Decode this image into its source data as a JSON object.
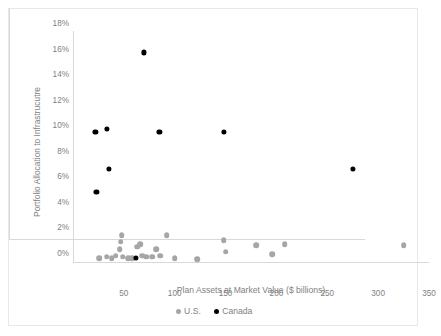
{
  "chart_data": {
    "type": "scatter",
    "title": "",
    "xlabel": "Plan Assets at Market Value ($ billions)",
    "ylabel": "Portfolio Allocation to Infrastrucutre",
    "xlim": [
      0,
      350
    ],
    "ylim": [
      0,
      18
    ],
    "xticks": [
      "50",
      "100",
      "150",
      "200",
      "250",
      "300",
      "350"
    ],
    "xtick_values": [
      50,
      100,
      150,
      200,
      250,
      300,
      350
    ],
    "yticks": [
      "0%",
      "2%",
      "4%",
      "6%",
      "8%",
      "10%",
      "12%",
      "14%",
      "16%",
      "18%"
    ],
    "ytick_values": [
      0,
      2,
      4,
      6,
      8,
      10,
      12,
      14,
      16,
      18
    ],
    "grid": false,
    "legend_position": "bottom-center",
    "series": [
      {
        "name": "U.S.",
        "color": "#a6a6a6",
        "marker": "circle",
        "points": [
          {
            "x": 26,
            "y": 0.3
          },
          {
            "x": 33,
            "y": 0.4
          },
          {
            "x": 38,
            "y": 0.3
          },
          {
            "x": 42,
            "y": 0.5
          },
          {
            "x": 46,
            "y": 1.0
          },
          {
            "x": 47,
            "y": 1.6
          },
          {
            "x": 48,
            "y": 2.1
          },
          {
            "x": 49,
            "y": 0.4
          },
          {
            "x": 54,
            "y": 0.3
          },
          {
            "x": 58,
            "y": 0.3
          },
          {
            "x": 63,
            "y": 1.2
          },
          {
            "x": 66,
            "y": 1.4
          },
          {
            "x": 68,
            "y": 0.5
          },
          {
            "x": 72,
            "y": 0.4
          },
          {
            "x": 78,
            "y": 0.4
          },
          {
            "x": 82,
            "y": 1.0
          },
          {
            "x": 86,
            "y": 0.5
          },
          {
            "x": 92,
            "y": 2.1
          },
          {
            "x": 100,
            "y": 0.3
          },
          {
            "x": 122,
            "y": 0.2
          },
          {
            "x": 148,
            "y": 1.7
          },
          {
            "x": 150,
            "y": 0.8
          },
          {
            "x": 180,
            "y": 1.3
          },
          {
            "x": 196,
            "y": 0.6
          },
          {
            "x": 208,
            "y": 1.4
          },
          {
            "x": 325,
            "y": 1.3
          }
        ]
      },
      {
        "name": "Canada",
        "color": "#000000",
        "marker": "circle",
        "points": [
          {
            "x": 22,
            "y": 10.2
          },
          {
            "x": 23,
            "y": 5.5
          },
          {
            "x": 33,
            "y": 10.4
          },
          {
            "x": 35,
            "y": 7.3
          },
          {
            "x": 62,
            "y": 0.3
          },
          {
            "x": 70,
            "y": 16.4
          },
          {
            "x": 85,
            "y": 10.2
          },
          {
            "x": 148,
            "y": 10.2
          },
          {
            "x": 275,
            "y": 7.3
          }
        ]
      }
    ]
  },
  "legend": {
    "items": [
      {
        "label": "U.S.",
        "color": "#a6a6a6"
      },
      {
        "label": "Canada",
        "color": "#000000"
      }
    ]
  }
}
